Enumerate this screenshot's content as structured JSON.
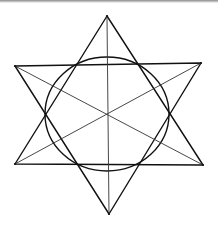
{
  "figure": {
    "colors": {
      "ink": "#111111",
      "background": "#ffffff",
      "top_strip": "#8a8a8a"
    },
    "vertices": {
      "top": [
        107,
        16
      ],
      "upper_left": [
        15,
        66
      ],
      "upper_right": [
        201,
        63
      ],
      "lower_left": [
        15,
        164
      ],
      "lower_right": [
        203,
        165
      ],
      "bottom": [
        109,
        214
      ]
    },
    "center": [
      107,
      115
    ],
    "circle": {
      "cx": 107,
      "cy": 114,
      "rx": 62,
      "ry": 57
    },
    "triangles": [
      {
        "name": "upward",
        "points": [
          "top",
          "lower_left",
          "lower_right"
        ]
      },
      {
        "name": "downward",
        "points": [
          "bottom",
          "upper_left",
          "upper_right"
        ]
      }
    ],
    "diagonals": [
      [
        "top",
        "bottom"
      ],
      [
        "upper_left",
        "lower_right"
      ],
      [
        "upper_right",
        "lower_left"
      ]
    ]
  }
}
